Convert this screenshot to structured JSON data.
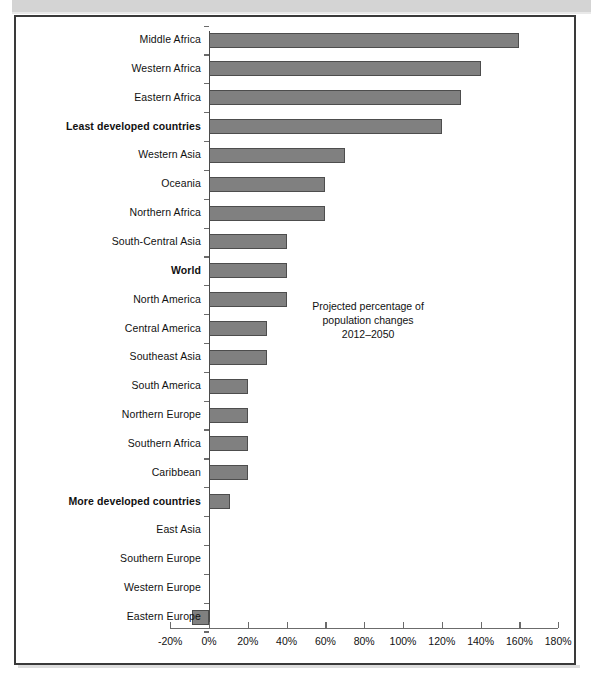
{
  "chart_data": {
    "type": "bar",
    "orientation": "horizontal",
    "title": "",
    "annotation": {
      "line1": "Projected percentage of",
      "line2": "population changes",
      "line3": "2012–2050"
    },
    "xlabel": "",
    "ylabel": "",
    "xlim": [
      -20,
      180
    ],
    "xticks": [
      -20,
      0,
      20,
      40,
      60,
      80,
      100,
      120,
      140,
      160,
      180
    ],
    "xticklabels": [
      "-20%",
      "0%",
      "20%",
      "40%",
      "60%",
      "80%",
      "100%",
      "120%",
      "140%",
      "160%",
      "180%"
    ],
    "grid": false,
    "legend": "none",
    "bar_color": "#808080",
    "bar_edge_color": "#4d4d4d",
    "categories": [
      "Middle Africa",
      "Western Africa",
      "Eastern Africa",
      "Least developed countries",
      "Western Asia",
      "Oceania",
      "Northern Africa",
      "South-Central Asia",
      "World",
      "North America",
      "Central America",
      "Southeast Asia",
      "South America",
      "Northern Europe",
      "Southern Africa",
      "Caribbean",
      "More developed countries",
      "East Asia",
      "Southern Europe",
      "Western Europe",
      "Eastern Europe"
    ],
    "values": [
      160,
      140,
      130,
      120,
      70,
      60,
      60,
      40,
      40,
      40,
      30,
      30,
      20,
      20,
      20,
      20,
      11,
      0,
      0,
      0,
      -9
    ],
    "bold_categories": [
      "Least developed countries",
      "World",
      "More developed countries"
    ]
  }
}
